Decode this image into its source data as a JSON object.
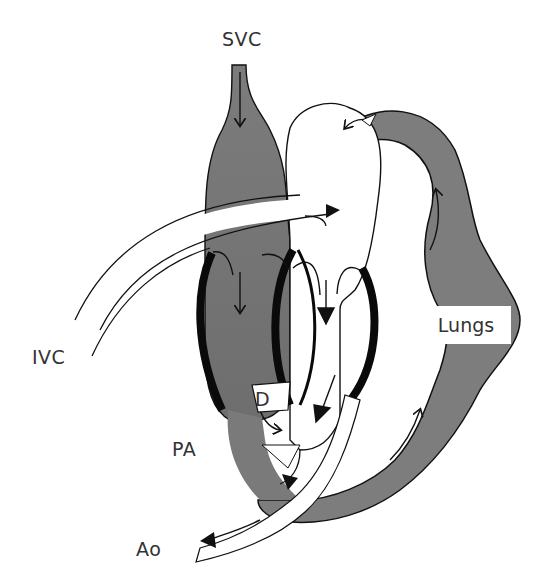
{
  "diagram": {
    "type": "fetal-circulation-heart-schematic",
    "labels": {
      "svc": "SVC",
      "ivc": "IVC",
      "lungs": "Lungs",
      "ductus": "D",
      "pa": "PA",
      "ao": "Ao"
    },
    "colors": {
      "deoxygenated_shade": "#7a7a7a",
      "oxygenated_white": "#ffffff",
      "outline": "#111111",
      "wall": "#0a0a0a"
    }
  }
}
